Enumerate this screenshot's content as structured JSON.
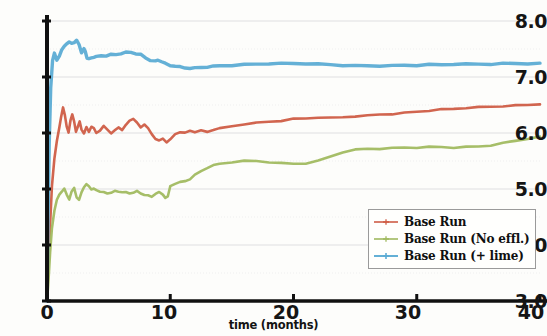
{
  "chart_data": {
    "type": "line",
    "title": "",
    "xlabel": "time (months)",
    "ylabel": "",
    "xlim": [
      0,
      40
    ],
    "ylim": [
      3.0,
      8.0
    ],
    "xticks": [
      0,
      10,
      20,
      30,
      40
    ],
    "xtick_labels": [
      "0",
      "10",
      "20",
      "30",
      "40"
    ],
    "yticks": [
      3.0,
      4.0,
      5.0,
      6.0,
      7.0,
      8.0
    ],
    "ytick_labels": [
      "3.0",
      "4.0",
      "5.0",
      "6.0",
      "7.0",
      "8.0"
    ],
    "grid": "horizontal major and minor (0.5 step), light gray dotted",
    "legend_position": "lower right",
    "series": [
      {
        "name": "Base Run",
        "color": "#cf5d46",
        "x": [
          0,
          0.1,
          0.25,
          0.4,
          0.6,
          0.8,
          1.0,
          1.15,
          1.3,
          1.45,
          1.6,
          1.75,
          1.9,
          2.05,
          2.2,
          2.35,
          2.5,
          2.65,
          2.8,
          3.0,
          3.2,
          3.4,
          3.6,
          3.8,
          4.0,
          4.3,
          4.6,
          4.9,
          5.2,
          5.5,
          5.8,
          6.1,
          6.4,
          6.7,
          7.0,
          7.3,
          7.6,
          7.9,
          8.2,
          8.5,
          8.8,
          9.1,
          9.4,
          9.7,
          10.0,
          10.4,
          10.8,
          11.2,
          11.6,
          12.0,
          12.5,
          13.0,
          13.5,
          14.0,
          15.0,
          16.0,
          17.0,
          18.0,
          19.0,
          20.0,
          21.0,
          22.0,
          23.0,
          24.0,
          25.0,
          26.0,
          27.0,
          28.0,
          29.0,
          30.0,
          31.0,
          32.0,
          33.0,
          34.0,
          35.0,
          36.0,
          37.0,
          38.0,
          39.0,
          40.0
        ],
        "y": [
          3.0,
          3.55,
          4.35,
          5.05,
          5.55,
          5.85,
          6.1,
          6.3,
          6.45,
          6.32,
          6.12,
          6.0,
          6.22,
          6.34,
          6.2,
          6.02,
          6.12,
          6.2,
          6.06,
          6.0,
          6.1,
          6.02,
          6.12,
          6.08,
          6.0,
          6.05,
          6.12,
          6.06,
          6.0,
          6.04,
          6.1,
          6.06,
          6.14,
          6.22,
          6.26,
          6.18,
          6.1,
          6.16,
          6.08,
          5.98,
          5.9,
          5.86,
          5.9,
          5.84,
          5.88,
          5.98,
          6.02,
          6.0,
          6.04,
          6.02,
          6.04,
          6.02,
          6.06,
          6.08,
          6.12,
          6.16,
          6.18,
          6.2,
          6.22,
          6.25,
          6.26,
          6.28,
          6.27,
          6.28,
          6.3,
          6.31,
          6.33,
          6.34,
          6.36,
          6.38,
          6.4,
          6.42,
          6.43,
          6.45,
          6.46,
          6.47,
          6.48,
          6.49,
          6.5,
          6.52
        ]
      },
      {
        "name": "Base Run (No effl.)",
        "color": "#a1ba60",
        "x": [
          0,
          0.1,
          0.25,
          0.4,
          0.6,
          0.8,
          1.0,
          1.2,
          1.4,
          1.6,
          1.8,
          2.0,
          2.2,
          2.4,
          2.6,
          2.8,
          3.0,
          3.2,
          3.4,
          3.6,
          3.8,
          4.0,
          4.3,
          4.6,
          4.9,
          5.2,
          5.5,
          5.8,
          6.1,
          6.4,
          6.7,
          7.0,
          7.3,
          7.6,
          7.9,
          8.2,
          8.5,
          8.8,
          9.1,
          9.4,
          9.6,
          9.8,
          10.0,
          10.4,
          10.8,
          11.2,
          11.6,
          12.0,
          12.5,
          13.0,
          13.5,
          14.0,
          15.0,
          16.0,
          17.0,
          18.0,
          19.0,
          20.0,
          21.0,
          22.0,
          23.0,
          24.0,
          25.0,
          26.0,
          27.0,
          28.0,
          29.0,
          30.0,
          31.0,
          32.0,
          33.0,
          34.0,
          35.0,
          36.0,
          37.0,
          38.0,
          39.0,
          40.0
        ],
        "y": [
          3.0,
          3.3,
          3.85,
          4.3,
          4.62,
          4.8,
          4.9,
          4.96,
          5.0,
          4.9,
          4.82,
          4.95,
          5.02,
          4.86,
          4.8,
          4.94,
          5.04,
          5.08,
          5.05,
          5.0,
          5.0,
          4.98,
          4.96,
          4.94,
          4.92,
          4.94,
          4.96,
          4.95,
          4.95,
          4.94,
          4.92,
          4.94,
          4.96,
          4.92,
          4.9,
          4.88,
          4.86,
          4.92,
          4.94,
          4.9,
          4.85,
          4.86,
          5.05,
          5.1,
          5.12,
          5.14,
          5.18,
          5.25,
          5.32,
          5.38,
          5.42,
          5.45,
          5.48,
          5.5,
          5.5,
          5.48,
          5.46,
          5.45,
          5.46,
          5.5,
          5.58,
          5.66,
          5.7,
          5.72,
          5.72,
          5.73,
          5.74,
          5.74,
          5.75,
          5.75,
          5.74,
          5.75,
          5.76,
          5.78,
          5.82,
          5.86,
          5.9,
          5.93
        ]
      },
      {
        "name": "Base Run (+ lime)",
        "color": "#5cacd4",
        "x": [
          0,
          0.08,
          0.18,
          0.3,
          0.45,
          0.6,
          0.8,
          1.0,
          1.2,
          1.4,
          1.6,
          1.8,
          2.0,
          2.2,
          2.4,
          2.6,
          2.8,
          3.0,
          3.1,
          3.25,
          3.4,
          3.6,
          3.8,
          4.0,
          4.4,
          4.8,
          5.2,
          5.6,
          6.0,
          6.4,
          6.8,
          7.2,
          7.6,
          8.0,
          8.4,
          8.8,
          9.0,
          9.3,
          9.6,
          10.0,
          10.4,
          10.8,
          11.2,
          11.6,
          12.0,
          12.5,
          13.0,
          13.5,
          14.0,
          15.0,
          16.0,
          17.0,
          18.0,
          19.0,
          20.0,
          21.0,
          22.0,
          23.0,
          24.0,
          25.0,
          26.0,
          27.0,
          28.0,
          29.0,
          30.0,
          31.0,
          32.0,
          33.0,
          34.0,
          35.0,
          36.0,
          37.0,
          38.0,
          39.0,
          40.0
        ],
        "y": [
          3.0,
          4.4,
          5.8,
          6.8,
          7.3,
          7.42,
          7.3,
          7.38,
          7.48,
          7.55,
          7.6,
          7.62,
          7.6,
          7.62,
          7.65,
          7.58,
          7.44,
          7.5,
          7.46,
          7.34,
          7.32,
          7.34,
          7.36,
          7.36,
          7.38,
          7.38,
          7.4,
          7.4,
          7.42,
          7.44,
          7.44,
          7.42,
          7.4,
          7.34,
          7.3,
          7.28,
          7.3,
          7.28,
          7.24,
          7.2,
          7.2,
          7.18,
          7.16,
          7.16,
          7.16,
          7.17,
          7.18,
          7.19,
          7.2,
          7.21,
          7.22,
          7.23,
          7.24,
          7.24,
          7.24,
          7.24,
          7.23,
          7.22,
          7.21,
          7.2,
          7.2,
          7.2,
          7.2,
          7.21,
          7.21,
          7.22,
          7.22,
          7.23,
          7.23,
          7.23,
          7.23,
          7.24,
          7.24,
          7.24,
          7.24
        ]
      }
    ]
  },
  "axes": {
    "xlabel": "time (months)",
    "ytick_labels": [
      "8.0",
      "7.0",
      "6.0",
      "5.0",
      "4.0",
      "3.0"
    ],
    "xtick_labels": [
      "0",
      "10",
      "20",
      "30",
      "40"
    ]
  },
  "legend": {
    "entries": [
      {
        "label": "Base Run",
        "color": "#cf5d46"
      },
      {
        "label": "Base Run (No effl.)",
        "color": "#a1ba60"
      },
      {
        "label": "Base Run (+ lime)",
        "color": "#5cacd4"
      }
    ]
  },
  "colors": {
    "base_run": "#cf5d46",
    "no_effl": "#a1ba60",
    "plus_lime": "#5cacd4",
    "axis": "#101010",
    "grid": "#cfcfd6",
    "background": "#fdfdfb"
  }
}
